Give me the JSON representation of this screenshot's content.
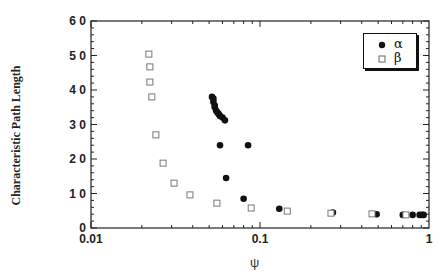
{
  "chart_data": {
    "type": "scatter",
    "title": "",
    "xlabel": "ψ",
    "ylabel": "Characteristic Path Length",
    "xscale": "log",
    "xlim": [
      0.01,
      1
    ],
    "ylim": [
      0,
      60
    ],
    "xticks": [
      "0.01",
      "0.1",
      "1"
    ],
    "yticks": [
      "0",
      "1 0",
      "2 0",
      "3 0",
      "4 0",
      "5 0",
      "6 0"
    ],
    "grid": false,
    "legend_position": "upper right",
    "series": [
      {
        "name": "α",
        "marker": "filled-circle",
        "x": [
          0.052,
          0.053,
          0.053,
          0.054,
          0.054,
          0.055,
          0.056,
          0.057,
          0.058,
          0.06,
          0.062,
          0.058,
          0.085,
          0.063,
          0.08,
          0.13,
          0.27,
          0.49,
          0.7,
          0.8,
          0.88,
          0.91,
          0.93
        ],
        "y": [
          38.0,
          37.5,
          36.5,
          35.5,
          35.0,
          34.0,
          33.5,
          33.0,
          32.5,
          32.0,
          31.2,
          24.0,
          24.0,
          14.5,
          8.5,
          5.6,
          4.5,
          4.0,
          3.8,
          3.8,
          3.8,
          3.8,
          3.8
        ]
      },
      {
        "name": "β",
        "marker": "open-square",
        "x": [
          0.022,
          0.0223,
          0.0223,
          0.0229,
          0.0242,
          0.0267,
          0.031,
          0.0385,
          0.0556,
          0.0887,
          0.145,
          0.263,
          0.46,
          0.73
        ],
        "y": [
          50.4,
          46.7,
          42.3,
          38.0,
          27.0,
          18.8,
          13.0,
          9.6,
          7.2,
          5.8,
          4.9,
          4.3,
          4.1,
          3.8
        ]
      }
    ]
  },
  "legend": {
    "items": [
      {
        "label": "α"
      },
      {
        "label": "β"
      }
    ]
  },
  "axes": {
    "xlabel": "ψ",
    "ylabel": "Characteristic Path Length"
  }
}
